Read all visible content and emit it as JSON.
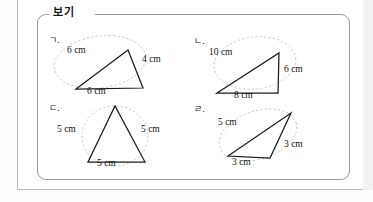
{
  "worksheet": {
    "legend_label": "보기",
    "items": [
      {
        "marker": "ㄱ.",
        "name": "triangle-scalene-6-4-6",
        "sides": [
          {
            "label": "6 cm",
            "position": "upper-left"
          },
          {
            "label": "4 cm",
            "position": "right"
          },
          {
            "label": "6 cm",
            "position": "bottom"
          }
        ]
      },
      {
        "marker": "ㄴ.",
        "name": "triangle-right-10-6-8",
        "sides": [
          {
            "label": "10 cm",
            "position": "hypotenuse"
          },
          {
            "label": "6 cm",
            "position": "right"
          },
          {
            "label": "8 cm",
            "position": "bottom"
          }
        ]
      },
      {
        "marker": "ㄷ.",
        "name": "triangle-equilateral-5-5-5",
        "sides": [
          {
            "label": "5 cm",
            "position": "left"
          },
          {
            "label": "5 cm",
            "position": "right"
          },
          {
            "label": "5 cm",
            "position": "bottom"
          }
        ]
      },
      {
        "marker": "ㄹ.",
        "name": "triangle-obtuse-5-3-3",
        "sides": [
          {
            "label": "5 cm",
            "position": "upper-left"
          },
          {
            "label": "3 cm",
            "position": "right"
          },
          {
            "label": "3 cm",
            "position": "bottom"
          }
        ]
      }
    ]
  },
  "colors": {
    "stroke": "#1c1c1c",
    "halo": "#bdbdbd",
    "border": "#9a9a9a",
    "text": "#111111",
    "page": "#ffffff"
  }
}
